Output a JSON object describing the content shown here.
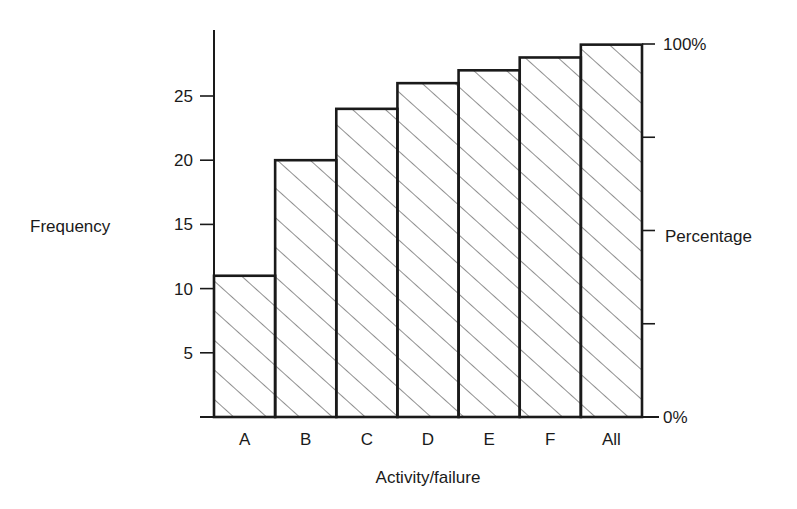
{
  "chart_data": {
    "type": "bar",
    "title": "",
    "xlabel": "Activity/failure",
    "ylabel": "Frequency",
    "y2label": "Percentage",
    "categories": [
      "A",
      "B",
      "C",
      "D",
      "E",
      "F",
      "All"
    ],
    "values": [
      11,
      20,
      24,
      26,
      27,
      28,
      29
    ],
    "ylim": [
      0,
      29
    ],
    "yticks": [
      5,
      10,
      15,
      20,
      25
    ],
    "y2ticks": [
      {
        "value": 0,
        "label": "0%"
      },
      {
        "value": 25,
        "label": ""
      },
      {
        "value": 50,
        "label": ""
      },
      {
        "value": 75,
        "label": ""
      },
      {
        "value": 100,
        "label": "100%"
      }
    ],
    "y2lim": [
      0,
      100
    ],
    "grid": false,
    "legend": null,
    "fill": "diagonal-hatch",
    "note": "Cumulative frequency (Pareto-style) bar chart; All = 100%"
  },
  "colors": {
    "ink": "#1a1a1a",
    "hatch": "#333333",
    "background": "#ffffff"
  }
}
